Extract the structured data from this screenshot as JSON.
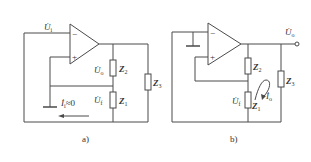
{
  "figure": {
    "panels": [
      {
        "id": "a",
        "caption": "a)",
        "labels": {
          "input_voltage": "U̇",
          "input_voltage_sub": "i",
          "output_voltage": "U̇",
          "output_voltage_sub": "o",
          "feedback_voltage": "U̇",
          "feedback_voltage_sub": "f",
          "z2": "Z",
          "z2_sub": "2",
          "z1": "Z",
          "z1_sub": "1",
          "z3": "Z",
          "z3_sub": "3",
          "current": "İ",
          "current_sub": "i",
          "current_approx": "≈0"
        }
      },
      {
        "id": "b",
        "caption": "b)",
        "labels": {
          "output_voltage": "U̇",
          "output_voltage_sub": "o",
          "feedback_voltage": "U̇",
          "feedback_voltage_sub": "f",
          "z2": "Z",
          "z2_sub": "2",
          "z1": "Z",
          "z1_sub": "1",
          "z3": "Z",
          "z3_sub": "3",
          "current": "İ",
          "current_sub": "o"
        }
      }
    ],
    "opamp_inputs": {
      "minus": "−",
      "plus": "+"
    }
  }
}
